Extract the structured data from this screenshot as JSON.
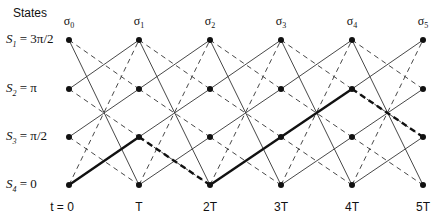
{
  "title": "States",
  "states": [
    {
      "name": "S",
      "sub": "1",
      "eq": " = ",
      "value": "3π/2",
      "y": 40
    },
    {
      "name": "S",
      "sub": "2",
      "eq": " = ",
      "value": "π",
      "y": 89
    },
    {
      "name": "S",
      "sub": "3",
      "eq": " = ",
      "value": "π/2",
      "y": 137
    },
    {
      "name": "S",
      "sub": "4",
      "eq": " = ",
      "value": "0",
      "y": 185
    }
  ],
  "sigmas": [
    {
      "label": "σ",
      "sub": "0",
      "x": 69
    },
    {
      "label": "σ",
      "sub": "1",
      "x": 139
    },
    {
      "label": "σ",
      "sub": "2",
      "x": 210
    },
    {
      "label": "σ",
      "sub": "3",
      "x": 281
    },
    {
      "label": "σ",
      "sub": "4",
      "x": 352
    },
    {
      "label": "σ",
      "sub": "5",
      "x": 423
    }
  ],
  "times": [
    {
      "label": "t = 0",
      "x": 62
    },
    {
      "label": "T",
      "x": 139
    },
    {
      "label": "2T",
      "x": 210
    },
    {
      "label": "3T",
      "x": 281
    },
    {
      "label": "4T",
      "x": 352
    },
    {
      "label": "5T",
      "x": 423
    }
  ],
  "transitions": {
    "solid": [
      [
        0,
        3
      ],
      [
        1,
        0
      ],
      [
        2,
        1
      ],
      [
        3,
        2
      ]
    ],
    "dashed": [
      [
        0,
        1
      ],
      [
        1,
        2
      ],
      [
        2,
        3
      ],
      [
        3,
        0
      ]
    ]
  },
  "highlighted_path": [
    {
      "from": [
        0,
        3
      ],
      "to": [
        1,
        2
      ],
      "style": "solid"
    },
    {
      "from": [
        1,
        2
      ],
      "to": [
        2,
        3
      ],
      "style": "dashed"
    },
    {
      "from": [
        2,
        3
      ],
      "to": [
        3,
        2
      ],
      "style": "solid"
    },
    {
      "from": [
        3,
        2
      ],
      "to": [
        4,
        1
      ],
      "style": "solid"
    },
    {
      "from": [
        4,
        1
      ],
      "to": [
        5,
        2
      ],
      "style": "dashed"
    }
  ],
  "colors": {
    "line": "#333333",
    "bold": "#111111",
    "node": "#111111"
  }
}
